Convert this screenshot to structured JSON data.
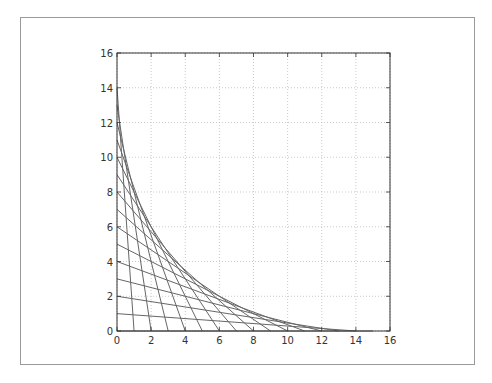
{
  "chart_data": {
    "type": "line",
    "title": "",
    "xlabel": "",
    "ylabel": "",
    "xlim": [
      0,
      16
    ],
    "ylim": [
      0,
      16
    ],
    "grid": true,
    "legend": null,
    "x_ticks": [
      "0",
      "2",
      "4",
      "6",
      "8",
      "10",
      "12",
      "14",
      "16"
    ],
    "y_ticks": [
      "0",
      "2",
      "4",
      "6",
      "8",
      "10",
      "12",
      "14",
      "16"
    ],
    "line_color": "#666666",
    "series": [
      {
        "name": "seg1",
        "x": [
          0,
          1
        ],
        "y": [
          14,
          0
        ]
      },
      {
        "name": "seg2",
        "x": [
          0,
          2
        ],
        "y": [
          13,
          0
        ]
      },
      {
        "name": "seg3",
        "x": [
          0,
          3
        ],
        "y": [
          12,
          0
        ]
      },
      {
        "name": "seg4",
        "x": [
          0,
          4
        ],
        "y": [
          11,
          0
        ]
      },
      {
        "name": "seg5",
        "x": [
          0,
          5
        ],
        "y": [
          10,
          0
        ]
      },
      {
        "name": "seg6",
        "x": [
          0,
          6
        ],
        "y": [
          9,
          0
        ]
      },
      {
        "name": "seg7",
        "x": [
          0,
          7
        ],
        "y": [
          8,
          0
        ]
      },
      {
        "name": "seg8",
        "x": [
          0,
          8
        ],
        "y": [
          7,
          0
        ]
      },
      {
        "name": "seg9",
        "x": [
          0,
          9
        ],
        "y": [
          6,
          0
        ]
      },
      {
        "name": "seg10",
        "x": [
          0,
          10
        ],
        "y": [
          5,
          0
        ]
      },
      {
        "name": "seg11",
        "x": [
          0,
          11
        ],
        "y": [
          4,
          0
        ]
      },
      {
        "name": "seg12",
        "x": [
          0,
          12
        ],
        "y": [
          3,
          0
        ]
      },
      {
        "name": "seg13",
        "x": [
          0,
          13
        ],
        "y": [
          2,
          0
        ]
      },
      {
        "name": "seg14",
        "x": [
          0,
          14
        ],
        "y": [
          1,
          0
        ]
      },
      {
        "name": "seg15",
        "x": [
          0,
          15
        ],
        "y": [
          0,
          0
        ]
      }
    ]
  },
  "plot_box": {
    "left": 117,
    "right": 390,
    "top": 53,
    "bottom": 331
  }
}
